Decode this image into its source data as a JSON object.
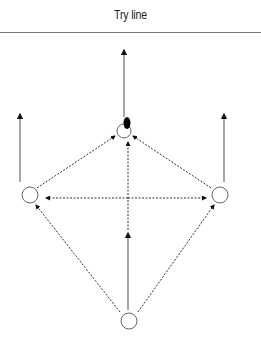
{
  "diagram": {
    "title": "Try line",
    "colors": {
      "stroke": "#333333",
      "line": "#777777",
      "ball": "#000000"
    },
    "players": [
      {
        "id": "top",
        "cx": 124,
        "cy": 131,
        "r": 7,
        "has_ball": true
      },
      {
        "id": "left",
        "cx": 30,
        "cy": 195,
        "r": 8,
        "has_ball": false
      },
      {
        "id": "right",
        "cx": 220,
        "cy": 195,
        "r": 8,
        "has_ball": false
      },
      {
        "id": "bottom",
        "cx": 129,
        "cy": 321,
        "r": 8,
        "has_ball": false
      }
    ],
    "solid_arrows": [
      {
        "from": "top",
        "x1": 124,
        "y1": 117,
        "x2": 124,
        "y2": 50
      },
      {
        "from": "left",
        "x1": 20,
        "y1": 182,
        "x2": 20,
        "y2": 114
      },
      {
        "from": "right",
        "x1": 224,
        "y1": 182,
        "x2": 224,
        "y2": 114
      },
      {
        "from": "bottom",
        "x1": 128,
        "y1": 310,
        "x2": 128,
        "y2": 233
      }
    ],
    "dashed_arrows": [
      {
        "label": "left-to-top",
        "x1": 37,
        "y1": 188,
        "x2": 115,
        "y2": 136
      },
      {
        "label": "right-to-top",
        "x1": 211,
        "y1": 188,
        "x2": 133,
        "y2": 136
      },
      {
        "label": "bottom-to-top",
        "x1": 128,
        "y1": 230,
        "x2": 128,
        "y2": 142
      },
      {
        "label": "horizontal-to-left",
        "x1": 128,
        "y1": 198,
        "x2": 46,
        "y2": 198
      },
      {
        "label": "horizontal-to-right",
        "x1": 128,
        "y1": 198,
        "x2": 206,
        "y2": 198
      },
      {
        "label": "bottom-to-left",
        "x1": 120,
        "y1": 312,
        "x2": 36,
        "y2": 205
      },
      {
        "label": "bottom-to-right",
        "x1": 138,
        "y1": 312,
        "x2": 214,
        "y2": 205
      }
    ]
  }
}
